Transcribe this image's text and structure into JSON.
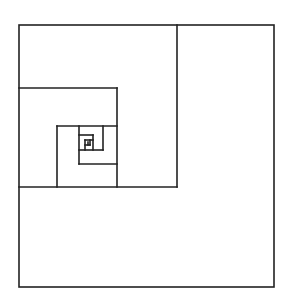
{
  "diagram": {
    "title": "",
    "type": "nested-square-spiral",
    "stroke_color": "#222222",
    "background": "#ffffff",
    "outer_box": {
      "x1": 19,
      "y1": 25,
      "x2": 274,
      "y2": 287
    },
    "segments": [
      {
        "id": "s1-v",
        "x1": 177,
        "y1": 25,
        "x2": 177,
        "y2": 187
      },
      {
        "id": "s1-h",
        "x1": 19,
        "y1": 187,
        "x2": 177,
        "y2": 187
      },
      {
        "id": "s2-h",
        "x1": 19,
        "y1": 88,
        "x2": 117,
        "y2": 88
      },
      {
        "id": "s2-v",
        "x1": 117,
        "y1": 88,
        "x2": 117,
        "y2": 187
      },
      {
        "id": "s3-h",
        "x1": 57,
        "y1": 126,
        "x2": 117,
        "y2": 126
      },
      {
        "id": "s3-v",
        "x1": 57,
        "y1": 126,
        "x2": 57,
        "y2": 187
      },
      {
        "id": "s4-v",
        "x1": 79,
        "y1": 126,
        "x2": 79,
        "y2": 164
      },
      {
        "id": "s4-h",
        "x1": 79,
        "y1": 164,
        "x2": 117,
        "y2": 164
      },
      {
        "id": "s5-h",
        "x1": 79,
        "y1": 150,
        "x2": 103,
        "y2": 150
      },
      {
        "id": "s5-v",
        "x1": 103,
        "y1": 126,
        "x2": 103,
        "y2": 150
      },
      {
        "id": "s6-h",
        "x1": 79,
        "y1": 135,
        "x2": 93,
        "y2": 135
      },
      {
        "id": "s6-v",
        "x1": 93,
        "y1": 135,
        "x2": 93,
        "y2": 150
      },
      {
        "id": "s7-v",
        "x1": 85,
        "y1": 140,
        "x2": 85,
        "y2": 150
      },
      {
        "id": "s7-h",
        "x1": 85,
        "y1": 140,
        "x2": 93,
        "y2": 140
      },
      {
        "id": "s8-h",
        "x1": 85,
        "y1": 145,
        "x2": 90,
        "y2": 145
      },
      {
        "id": "s8-v",
        "x1": 90,
        "y1": 140,
        "x2": 90,
        "y2": 145
      },
      {
        "id": "s9-v",
        "x1": 88,
        "y1": 142,
        "x2": 88,
        "y2": 145
      }
    ]
  }
}
